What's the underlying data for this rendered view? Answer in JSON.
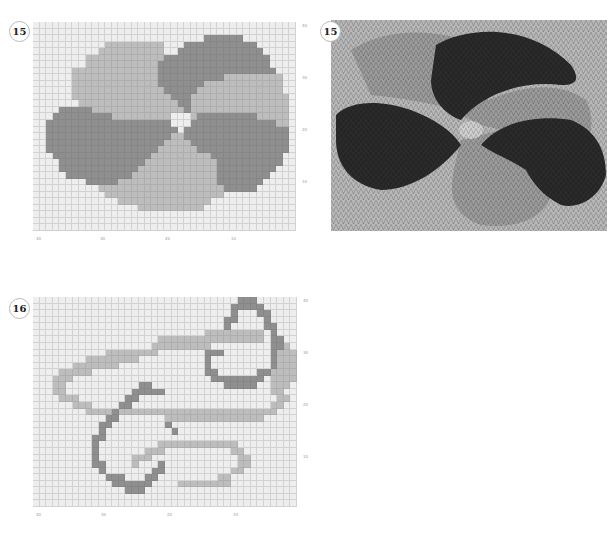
{
  "colors": {
    "background": "#eeeeee",
    "grid_line": "#d2d2d2",
    "light_grey": "#bdbdbd",
    "dark_grey": "#8f8f8f",
    "photo_base": "#b5b5b5",
    "photo_light": "#9a9a9a",
    "photo_dark": "#2b2b2b"
  },
  "charts": [
    {
      "id": "chart-15",
      "badge": "15",
      "x_ticks": [
        "40",
        "30",
        "20",
        "10"
      ],
      "y_ticks": [
        "40",
        "30",
        "20",
        "10"
      ],
      "cols": 40,
      "rows": 32
    },
    {
      "id": "chart-16",
      "badge": "16",
      "x_ticks": [
        "40",
        "30",
        "20",
        "10"
      ],
      "y_ticks": [
        "40",
        "30",
        "20",
        "10"
      ],
      "cols": 40,
      "rows": 32
    }
  ],
  "photo": {
    "badge": "15",
    "description": "knitted swatch of chart 15"
  },
  "chart_data": [
    {
      "type": "heatmap",
      "title": "15",
      "xlabel": "",
      "ylabel": "",
      "x_ticks": [
        "40",
        "30",
        "20",
        "10"
      ],
      "y_ticks": [
        "40",
        "30",
        "20",
        "10"
      ],
      "legend": {
        ".": "background",
        "L": "light grey",
        "D": "dark grey"
      },
      "grid": [
        "........................................",
        "........................................",
        "..........................DDDDDD........",
        "...........LLLLLLLLL...DDDDDDDDDDD......",
        "..........LLLLLLLLLL..DDDDDDDDDDDDD.....",
        "........LLLLLLLLLLLLDDDDDDDDDDDDDDDD....",
        "........LLLLLLLLLLLDDDDDDDDDDDDDDDDD....",
        "......LLLLLLLLLLLLLDDDDDDDDDDDDDDDDDD...",
        "......LLLLLLLLLLLLLDDDDDDDDDDLLLLLLLLL...",
        "......LLLLLLLLLLLLLDDDDDDDLLLLLLLLLLLL..",
        "......LLLLLLLLLLLLLLDDDDDLLLLLLLLLLLLL..",
        "......LLLLLLLLLLLLLLLDDDLLLLLLLLLLLLLLL.",
        ".......LLLLLLLLLLLLLLLDDLLLLLLLLLLLLLLL.",
        "....DDDDDLLLLLLLLLLLLLLDLLLLLLLLLLLLLLL.",
        "...DDDDDDDDDLLLLLLLLL...LDDDDDDDDDLLLLL.",
        "..DDDDDDDDDDDDDDDDDDD...DDDDDDDDDDDDDLL.",
        "..DDDDDDDDDDDDDDDDDDDD.DDDDDDDDDDDDDDDD.",
        "..DDDDDDDDDDDDDDDDDDDLLDDDDDDDDDDDDDDDD.",
        "..DDDDDDDDDDDDDDDDDDLLLLDDDDDDDDDDDDDDD.",
        "..DDDDDDDDDDDDDDDDDLLLLLLDDDDDDDDDDDDDD.",
        "...DDDDDDDDDDDDDDDLLLLLLLLLDDDDDDDDDDD..",
        "....DDDDDDDDDDDDDLLLLLLLLLLLDDDDDDDDDD..",
        "....DDDDDDDDDDDDLLLLLLLLLLLLDDDDDDDDD...",
        ".....DDDDDDDDDDLLLLLLLLLLLLLDDDDDDDD....",
        "........DDDDDLLLLLLLLLLLLLLLDDDDDDD.....",
        "..........LLLLLLLLLLLLLLLLLLLDDDDD......",
        "...........LLLLLLLLLLLLLLLLLL...........",
        ".............LLLLLLLLLLLLLL.............",
        "................LLLLLLLLLL..............",
        "........................................",
        "........................................",
        "........................................"
      ]
    },
    {
      "type": "heatmap",
      "title": "16",
      "xlabel": "",
      "ylabel": "",
      "x_ticks": [
        "40",
        "30",
        "20",
        "10"
      ],
      "y_ticks": [
        "40",
        "30",
        "20",
        "10"
      ],
      "legend": {
        ".": "background",
        "L": "light grey",
        "D": "dark grey"
      },
      "grid": [
        "...............................DDD......",
        "..............................DDDDD.....",
        "..............................D...DD....",
        ".............................DD....D....",
        ".............................D.....DD...",
        "..........................LLLLLLLLL.D...",
        "...................LLLLLLLLLLLLLLLL.DD..",
        "..................LLLLLLLLL.........DDL.",
        "...........LLLLLLLL.......DDD.......DLLL",
        "........LLLLLLLL..........D.........DLLL",
        "......LLLLLLL.............D.........DLLL",
        "....LLLLL.................DD......DDLLLL",
        "...LLL.....................DDDDDDDD.LLLL",
        "...LL...........DD...........DDDDD..LLL.",
        "...LL..........DDDDD................LL..",
        "....LLL.......DD.....................LL.",
        "......LLL....DD.....................LL..",
        "........LLLLDLLLLLLLLLLLLLLLLLLLLLLLL...",
        "...........DD.......LLLLLLLLLLLLLLL.....",
        "..........DD........D...................",
        "..........D..........D..................",
        ".........DD.........................",
        ".........D.........LLLLLLLLLLLL.........",
        ".........D.......LLL..........LL........",
        ".........D.....LLL.............LL.......",
        ".........DD....L...D...........LL.......",
        "..........D.......DD..........LL........",
        "...........DDD...DD.........LL..........",
        "............DDDDDD....LLLLLLLL..........",
        "..............DDD.......................",
        "........................................",
        "........................................"
      ]
    }
  ]
}
